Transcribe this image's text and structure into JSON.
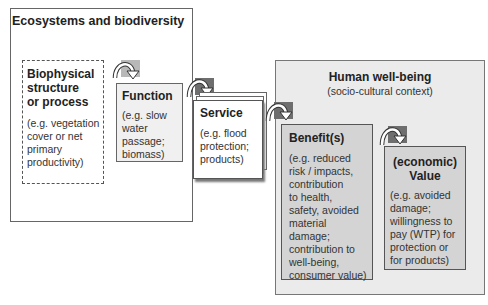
{
  "diagram": {
    "ecosystems": {
      "title": "Ecosystems and biodiversity"
    },
    "biophysical": {
      "title": [
        "Biophysical",
        "structure",
        "or process"
      ],
      "example": [
        "(e.g. vegetation",
        "cover or net",
        "primary",
        "productivity)"
      ]
    },
    "function": {
      "title": "Function",
      "example": [
        "(e.g. slow",
        "water",
        "passage;",
        "biomass)"
      ]
    },
    "service": {
      "title": "Service",
      "example": [
        "(e.g. flood",
        "protection;",
        "products)"
      ]
    },
    "human_wellbeing": {
      "title": "Human well-being",
      "subtitle": "(socio-cultural context)"
    },
    "benefit": {
      "title": "Benefit(s)",
      "example": [
        "(e.g. reduced",
        "risk / impacts,",
        "contribution",
        "to health,",
        "safety, avoided",
        "material",
        "damage;",
        "contribution to",
        "well-being,",
        "consumer value)"
      ]
    },
    "value": {
      "title": [
        "(economic)",
        "Value"
      ],
      "example": [
        "(e.g. avoided",
        "damage;",
        "willingness to",
        "pay (WTP) for",
        "protection or",
        "for products)"
      ]
    },
    "arrows": [
      {
        "from": "biophysical",
        "to": "function",
        "icon": "curved-arrow-icon",
        "bg": "#b8b8b8"
      },
      {
        "from": "function",
        "to": "service",
        "icon": "curved-arrow-icon",
        "bg": "#6e6e6e"
      },
      {
        "from": "service",
        "to": "benefit",
        "icon": "curved-arrow-icon",
        "bg": "#6e6e6e"
      },
      {
        "from": "benefit",
        "to": "value",
        "icon": "curved-arrow-icon",
        "bg": "#6e6e6e"
      }
    ]
  }
}
